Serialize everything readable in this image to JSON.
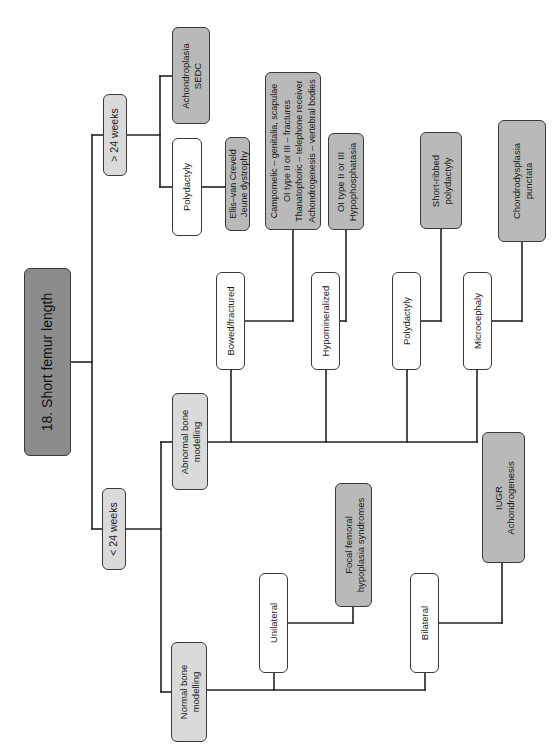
{
  "diagram": {
    "title": "18. Short femur length",
    "orientation": "rotated 90° counter-clockwise (root on left-middle, branches upward/rightward)",
    "colors": {
      "title_fill": "#8c8c8c",
      "category_fill": "#dadada",
      "diagnosis_fill": "#b9b9b9",
      "finding_fill": "#ffffff",
      "line": "#222222"
    },
    "nodes": {
      "root": "18. Short femur length",
      "gt24": "> 24 weeks",
      "lt24": "< 24 weeks",
      "achondroplasia": "Achondroplasia\nSEDC",
      "polydactyly_late": "Polydactyly",
      "ellis": "Ellis–van Creveld\nJeune dystrophy",
      "abnormal": "Abnormal bone\nmodelling",
      "normal": "Normal bone\nmodelling",
      "bowed": "Bowed/fractured",
      "campomelic": "Campomelic – genitalia, scapulae\nOI type II or III – fractures\nThanatophoric – telephone receiver\nAchondrogenesis – vertebral bodies",
      "hypomineralized": "Hypomineralized",
      "oi_hypo": "OI type II or III\nHypophosphatasia",
      "polydactyly_early": "Polydactyly",
      "short_ribbed": "Short-ribbed\npolydactyly",
      "microcephaly": "Microcephaly",
      "chondrodysplasia": "Chondrodysplasia\npunctata",
      "unilateral": "Unilateral",
      "focal_femoral": "Focal femoral\nhypoplasia syndromes",
      "bilateral": "Bilateral",
      "iugr": "IUGR\nAchondrogenesis"
    },
    "tree": {
      "label": "18. Short femur length",
      "children": [
        {
          "label": "> 24 weeks",
          "children": [
            {
              "label": "Achondroplasia / SEDC"
            },
            {
              "label": "Polydactyly",
              "children": [
                {
                  "label": "Ellis–van Creveld / Jeune dystrophy"
                }
              ]
            }
          ]
        },
        {
          "label": "< 24 weeks",
          "children": [
            {
              "label": "Abnormal bone modelling",
              "children": [
                {
                  "label": "Bowed/fractured",
                  "children": [
                    {
                      "label": "Campomelic – genitalia, scapulae; OI type II or III – fractures; Thanatophoric – telephone receiver; Achondrogenesis – vertebral bodies"
                    }
                  ]
                },
                {
                  "label": "Hypomineralized",
                  "children": [
                    {
                      "label": "OI type II or III / Hypophosphatasia"
                    }
                  ]
                },
                {
                  "label": "Polydactyly",
                  "children": [
                    {
                      "label": "Short-ribbed polydactyly"
                    }
                  ]
                },
                {
                  "label": "Microcephaly",
                  "children": [
                    {
                      "label": "Chondrodysplasia punctata"
                    }
                  ]
                }
              ]
            },
            {
              "label": "Normal bone modelling",
              "children": [
                {
                  "label": "Unilateral",
                  "children": [
                    {
                      "label": "Focal femoral hypoplasia syndromes"
                    }
                  ]
                },
                {
                  "label": "Bilateral",
                  "children": [
                    {
                      "label": "IUGR / Achondrogenesis"
                    }
                  ]
                }
              ]
            }
          ]
        }
      ]
    }
  }
}
